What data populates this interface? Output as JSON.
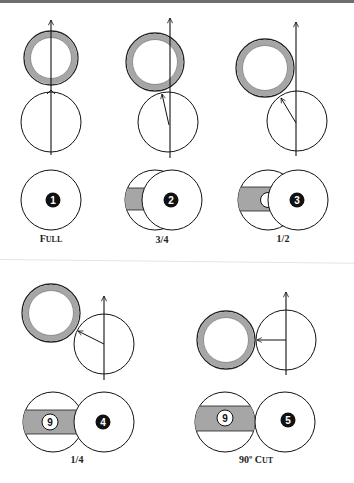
{
  "colors": {
    "ring_fill": "#a6a6a6",
    "ring_stroke": "#222222",
    "stripe_fill": "#a6a6a6",
    "line": "#111111",
    "badge_fill": "#111111",
    "badge_text": "#ffffff",
    "background": "#ffffff"
  },
  "panels": [
    {
      "id": "full",
      "label_first": "F",
      "label_rest": "ULL",
      "object_ball_number": "1",
      "shows_nine_ball": false
    },
    {
      "id": "three-quarter",
      "label": "3/4",
      "object_ball_number": "2",
      "shows_nine_ball": false
    },
    {
      "id": "half",
      "label": "1/2",
      "object_ball_number": "3",
      "shows_nine_ball": true,
      "nine_ball_partially_hidden": true
    },
    {
      "id": "quarter",
      "label": "1/4",
      "object_ball_number": "4",
      "nine_ball_number": "9",
      "shows_nine_ball": true
    },
    {
      "id": "ninety-cut",
      "label_main": "90º ",
      "label_first": "C",
      "label_rest": "UT",
      "object_ball_number": "5",
      "nine_ball_number": "9",
      "shows_nine_ball": true
    }
  ]
}
